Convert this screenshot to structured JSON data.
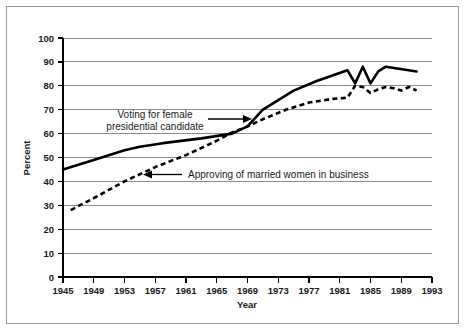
{
  "chart_data": {
    "type": "line",
    "title": "",
    "xlabel": "Year",
    "ylabel": "Percent",
    "xlim": [
      1945,
      1993
    ],
    "ylim": [
      0,
      100
    ],
    "grid": true,
    "legend_position": "inline-annotations",
    "xticks": [
      1945,
      1949,
      1953,
      1957,
      1961,
      1965,
      1969,
      1973,
      1977,
      1981,
      1985,
      1989,
      1993
    ],
    "yticks": [
      0,
      10,
      20,
      30,
      40,
      50,
      60,
      70,
      80,
      90,
      100
    ],
    "series": [
      {
        "name": "Voting for female presidential candidate",
        "style": "solid",
        "x": [
          1945,
          1949,
          1953,
          1955,
          1958,
          1963,
          1967,
          1969,
          1971,
          1975,
          1978,
          1982,
          1983,
          1984,
          1985,
          1986,
          1987,
          1991
        ],
        "values": [
          45,
          49,
          53,
          54.5,
          56,
          58,
          60,
          63,
          70,
          78,
          82,
          86.5,
          81,
          88,
          81,
          86,
          88,
          86
        ]
      },
      {
        "name": "Approving of married women in business",
        "style": "dashed",
        "x": [
          1946,
          1949,
          1953,
          1957,
          1961,
          1965,
          1967,
          1969,
          1971,
          1974,
          1977,
          1980,
          1982,
          1983,
          1984,
          1985,
          1986,
          1987,
          1988,
          1989,
          1990,
          1991
        ],
        "values": [
          28,
          33,
          40,
          46,
          51,
          57,
          60.5,
          63,
          66,
          70,
          73,
          74.5,
          75,
          80,
          79.5,
          77,
          78.5,
          79.5,
          79,
          78,
          79.5,
          78
        ]
      }
    ],
    "annotations": [
      {
        "id": "voting-annotation",
        "line1": "Voting for female",
        "line2": "presidential candidate",
        "points_to": "solid-series"
      },
      {
        "id": "approving-annotation",
        "line1": "Approving of married women in business",
        "line2": "",
        "points_to": "dashed-series"
      }
    ]
  },
  "colors": {
    "series_stroke": "#000000",
    "gridline": "#8c8c8c",
    "frame": "#9a9a9a",
    "background": "#ffffff",
    "text": "#1a1a1a"
  }
}
